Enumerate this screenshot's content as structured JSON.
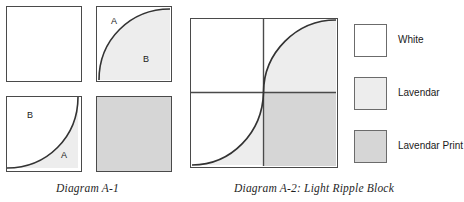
{
  "colors": {
    "white": "#ffffff",
    "lavendar": "#ededed",
    "lavendar_print": "#d6d6d6",
    "outline": "#4a4a4a",
    "swatch_outline": "#6b6b6b",
    "curve": "#333333"
  },
  "diagram_a1": {
    "caption": "Diagram A-1",
    "squares": [
      {
        "name": "square-plain-white",
        "fill": "white",
        "curve": "none",
        "labels": []
      },
      {
        "name": "square-curve-lavendar",
        "fill": "lavendar",
        "curve": "concave",
        "labels": [
          {
            "text": "A",
            "x": 14,
            "y": 10
          },
          {
            "text": "B",
            "x": 46,
            "y": 48
          }
        ]
      },
      {
        "name": "square-curve-lavendar-lower",
        "fill": "lavendar",
        "curve": "convex",
        "labels": [
          {
            "text": "B",
            "x": 20,
            "y": 14
          },
          {
            "text": "A",
            "x": 54,
            "y": 54
          }
        ]
      },
      {
        "name": "square-solid-lavendar-print",
        "fill": "lavendar_print",
        "curve": "none",
        "labels": []
      }
    ]
  },
  "diagram_a2": {
    "caption": "Diagram A-2: Light Ripple Block",
    "quadrants": [
      {
        "name": "quadrant-top-left",
        "fill": "white",
        "curve": "none"
      },
      {
        "name": "quadrant-top-right",
        "fill": "lavendar",
        "curve": "concave"
      },
      {
        "name": "quadrant-bottom-left",
        "fill": "lavendar",
        "curve": "convex"
      },
      {
        "name": "quadrant-bottom-right",
        "fill": "lavendar_print",
        "curve": "none"
      }
    ]
  },
  "legend": {
    "items": [
      {
        "label": "White",
        "fill": "white"
      },
      {
        "label": "Lavendar",
        "fill": "lavendar"
      },
      {
        "label": "Lavendar Print",
        "fill": "lavendar_print"
      }
    ]
  }
}
